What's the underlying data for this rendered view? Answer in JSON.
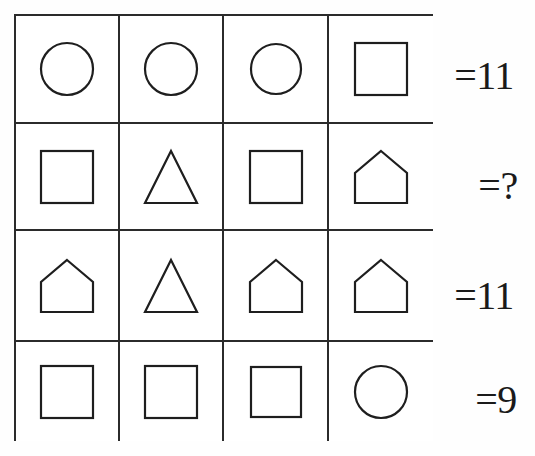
{
  "puzzle": {
    "type": "shape-equation-grid",
    "grid": {
      "rows": 4,
      "columns": 4,
      "cells": [
        [
          {
            "shape": "circle",
            "name": "circle-shape"
          },
          {
            "shape": "circle",
            "name": "circle-shape"
          },
          {
            "shape": "circle",
            "name": "circle-shape"
          },
          {
            "shape": "square",
            "name": "square-shape"
          }
        ],
        [
          {
            "shape": "square",
            "name": "square-shape"
          },
          {
            "shape": "triangle",
            "name": "triangle-shape"
          },
          {
            "shape": "square",
            "name": "square-shape"
          },
          {
            "shape": "house",
            "name": "house-shape"
          }
        ],
        [
          {
            "shape": "house",
            "name": "house-shape"
          },
          {
            "shape": "triangle",
            "name": "triangle-shape"
          },
          {
            "shape": "house",
            "name": "house-shape"
          },
          {
            "shape": "house",
            "name": "house-shape"
          }
        ],
        [
          {
            "shape": "square",
            "name": "square-shape"
          },
          {
            "shape": "square",
            "name": "square-shape"
          },
          {
            "shape": "square",
            "name": "square-shape"
          },
          {
            "shape": "circle",
            "name": "circle-shape"
          }
        ]
      ]
    },
    "row_totals": [
      {
        "label": "=11",
        "value": 11
      },
      {
        "label": "=?",
        "value": null
      },
      {
        "label": "=11",
        "value": 11
      },
      {
        "label": "=9",
        "value": 9
      }
    ],
    "colors": {
      "stroke": "#1e1e1e",
      "grid_line": "#2b2b2b",
      "background": "#ffffff",
      "text": "#1a1a1a"
    }
  }
}
